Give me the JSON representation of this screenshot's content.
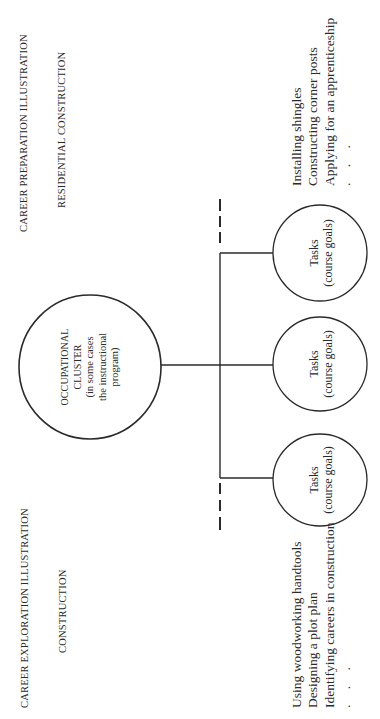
{
  "headings": {
    "preparation_title": "CAREER PREPARATION ILLUSTRATION",
    "preparation_subtitle": "RESIDENTIAL CONSTRUCTION",
    "exploration_title": "CAREER EXPLORATION ILLUSTRATION",
    "exploration_subtitle": "CONSTRUCTION"
  },
  "central_node": {
    "line1": "OCCUPATIONAL",
    "line2": "CLUSTER",
    "line3": "(in some cases",
    "line4": "the instructional",
    "line5": "program)"
  },
  "task_nodes": [
    {
      "title": "Tasks",
      "subtitle": "(course goals)"
    },
    {
      "title": "Tasks",
      "subtitle": "(course goals)"
    },
    {
      "title": "Tasks",
      "subtitle": "(course goals)"
    }
  ],
  "preparation_examples": {
    "items": [
      "Installing shingles",
      "Constructing corner posts",
      "Applying for an apprenticeship"
    ],
    "ellipsis": ". . ."
  },
  "exploration_examples": {
    "items": [
      "Using woodworking handtools",
      "Designing a plot plan",
      "Identifying careers in construction"
    ],
    "ellipsis": ". . ."
  },
  "colors": {
    "line": "#2a2a2a",
    "text": "#2a2a2a",
    "background": "#ffffff"
  }
}
